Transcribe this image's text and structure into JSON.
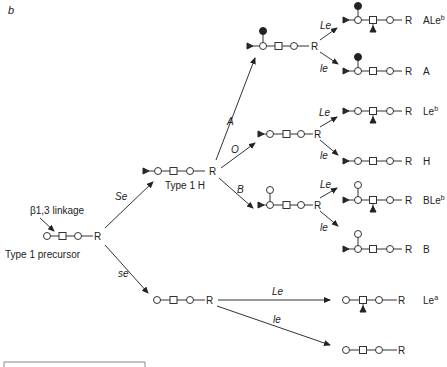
{
  "figure": {
    "panel_label": "b"
  },
  "precursor": {
    "label": "Type 1 precursor",
    "linkage_label": "β1,3 linkage",
    "r_label": "R"
  },
  "type1h": {
    "label": "Type 1 H",
    "r_label": "R"
  },
  "enzymes": {
    "se_upper": "Se",
    "se_lower": "se",
    "A": "A",
    "O": "O",
    "B": "B",
    "le_cap": "Le",
    "le_low": "le"
  },
  "intermediates": {
    "a_r": "R",
    "o_r": "R",
    "b_r": "R",
    "se_r": "R"
  },
  "products": [
    {
      "name": "ALe",
      "sup": "b",
      "r": "R"
    },
    {
      "name": "A",
      "sup": "",
      "r": "R"
    },
    {
      "name": "Le",
      "sup": "b",
      "r": "R"
    },
    {
      "name": "H",
      "sup": "",
      "r": "R"
    },
    {
      "name": "BLe",
      "sup": "b",
      "r": "R"
    },
    {
      "name": "B",
      "sup": "",
      "r": "R"
    },
    {
      "name": "Le",
      "sup": "a",
      "r": "R"
    },
    {
      "name": "",
      "sup": "",
      "r": "R"
    }
  ],
  "colors": {
    "ink": "#222222",
    "background": "#ffffff"
  }
}
